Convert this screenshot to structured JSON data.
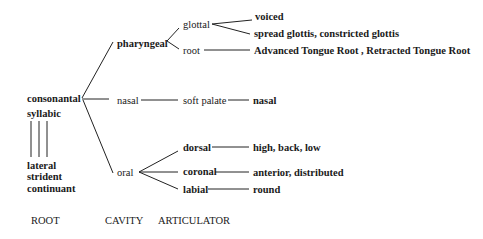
{
  "root_node": {
    "consonantal": "consonantal",
    "syllabic": "syllabic",
    "dependents": [
      "lateral",
      "strident",
      "continuant"
    ]
  },
  "cavity": {
    "pharyngeal": "pharyngeal",
    "nasal": "nasal",
    "oral": "oral"
  },
  "articulator": {
    "glottal": "glottal",
    "root": "root",
    "soft_palate": "soft palate",
    "dorsal": "dorsal",
    "coronal": "coronal",
    "labial": "labial"
  },
  "features": {
    "glottal_voiced": "voiced",
    "glottal_spread": "spread glottis, constricted glottis",
    "root": "Advanced Tongue Root , Retracted Tongue Root",
    "soft_palate": "nasal",
    "dorsal": "high, back, low",
    "coronal": "anterior, distributed",
    "labial": "round"
  },
  "tier_labels": {
    "root": "ROOT",
    "cavity": "CAVITY",
    "articulator": "ARTICULATOR"
  }
}
